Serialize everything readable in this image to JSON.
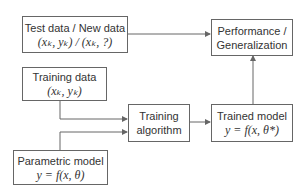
{
  "diagram": {
    "nodes": {
      "test_data": {
        "label": "Test data / New data",
        "math": "(xₖ, yₖ) / (xₖ, ?)"
      },
      "training_data": {
        "label": "Training data",
        "math": "(xₖ, yₖ)"
      },
      "parametric_model": {
        "label": "Parametric model",
        "math": "y = f(x, θ)"
      },
      "training_algorithm": {
        "label": "Training",
        "label2": "algorithm"
      },
      "trained_model": {
        "label": "Trained model",
        "math": "y = f(x, θ*)"
      },
      "performance": {
        "label": "Performance /",
        "label2": "Generalization"
      }
    },
    "edges": [
      {
        "from": "test_data",
        "to": "performance"
      },
      {
        "from": "training_data",
        "to": "training_algorithm"
      },
      {
        "from": "parametric_model",
        "to": "training_algorithm"
      },
      {
        "from": "training_algorithm",
        "to": "trained_model"
      },
      {
        "from": "trained_model",
        "to": "performance"
      }
    ],
    "colors": {
      "stroke": "#666666",
      "text": "#333333",
      "background": "#ffffff"
    }
  }
}
